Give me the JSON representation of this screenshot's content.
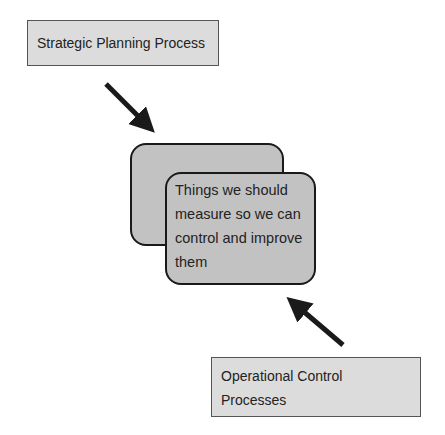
{
  "diagram": {
    "top_box": {
      "label": "Strategic Planning Process"
    },
    "center_card": {
      "text": "Things we should measure so we can control and improve them"
    },
    "bottom_box": {
      "line1": "Operational Control",
      "line2": "Processes"
    },
    "arrows": [
      {
        "name": "arrow-strategic-to-center",
        "from": [
          106,
          84
        ],
        "to": [
          152,
          130
        ]
      },
      {
        "name": "arrow-operational-to-center",
        "from": [
          343,
          345
        ],
        "to": [
          290,
          300
        ]
      }
    ],
    "colors": {
      "box_fill": "#dcdcdc",
      "card_fill": "#c2c2c2",
      "stroke": "#1a1a1a"
    }
  }
}
